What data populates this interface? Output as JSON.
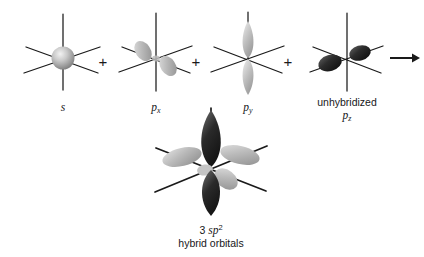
{
  "figure": {
    "type": "orbital-hybridization-diagram",
    "background_color": "#ffffff",
    "ink_color": "#1a1a1a",
    "arrow_symbol": "→",
    "plus_symbol": "+"
  },
  "operators": {
    "plus_1": "+",
    "plus_2": "+",
    "plus_3": "+",
    "arrow": "→"
  },
  "orbitals": [
    {
      "id": "s",
      "label_main": "s",
      "label_sub": "",
      "label_prefix": "",
      "shape": "sphere",
      "color": "#9e9e9e",
      "highlight": "#e8e8e8"
    },
    {
      "id": "px",
      "label_main": "p",
      "label_sub": "x",
      "label_prefix": "",
      "shape": "two-lobe-diagonal",
      "color": "#9b9b9b",
      "highlight": "#d6d6d6"
    },
    {
      "id": "py",
      "label_main": "p",
      "label_sub": "y",
      "label_prefix": "",
      "shape": "two-lobe-vertical",
      "color": "#a8a8a8",
      "highlight": "#dedede"
    },
    {
      "id": "pz",
      "label_main": "p",
      "label_sub": "z",
      "label_prefix": "unhybridized",
      "shape": "two-lobe-horizontal",
      "color": "#2e2e2e",
      "highlight": "#6a6a6a"
    }
  ],
  "product": {
    "id": "sp2-hybrid",
    "count": "3",
    "label_main": "sp",
    "label_sup": "2",
    "label_line2": "hybrid orbitals",
    "dark_color": "#1f1f1f",
    "light_color": "#b4b4b4",
    "lobe_count_light": 3,
    "lobe_count_dark": 2
  },
  "axes": {
    "count_per_orbital": 3,
    "orientations": [
      "vertical",
      "diagonal-up-right",
      "diagonal-down-right"
    ],
    "stroke_color": "#1a1a1a"
  }
}
